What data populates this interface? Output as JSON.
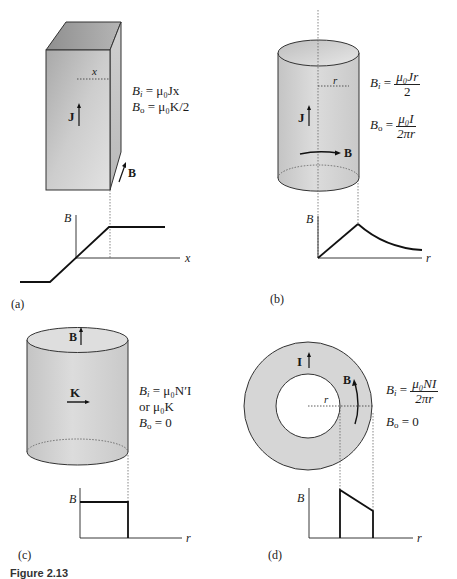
{
  "figure": {
    "caption_prefix": "Figure 2.13",
    "panels": [
      {
        "id": "a",
        "label": "(a)",
        "object": "thick slab",
        "labels": {
          "current_density": "J",
          "field": "B",
          "distance": "x"
        },
        "equations": {
          "inside_lhs": "B",
          "inside_sub": "i",
          "inside_rhs": "= μ₀Jx",
          "outside_lhs": "B",
          "outside_sub": "o",
          "outside_rhs": "= μ₀K/2"
        },
        "graph": {
          "ylabel": "B",
          "xlabel": "x"
        }
      },
      {
        "id": "b",
        "label": "(b)",
        "object": "solid cylinder",
        "labels": {
          "current_density": "J",
          "field": "B",
          "radius": "r"
        },
        "equations": {
          "inside_lhs": "B",
          "inside_sub": "i",
          "inside_num": "μ₀Jr",
          "inside_den": "2",
          "outside_lhs": "B",
          "outside_sub": "o",
          "outside_num": "μ₀I",
          "outside_den": "2πr"
        },
        "graph": {
          "ylabel": "B",
          "xlabel": "r"
        }
      },
      {
        "id": "c",
        "label": "(c)",
        "object": "solenoid",
        "labels": {
          "surface_current": "K",
          "field": "B"
        },
        "equations": {
          "inside_lhs": "B",
          "inside_sub": "i",
          "inside_rhs": "= μ₀N′I",
          "inside_alt": "or μ₀K",
          "outside_lhs": "B",
          "outside_sub": "o",
          "outside_rhs": "= 0"
        },
        "graph": {
          "ylabel": "B",
          "xlabel": "r"
        }
      },
      {
        "id": "d",
        "label": "(d)",
        "object": "toroid",
        "labels": {
          "current": "I",
          "field": "B",
          "radius": "r"
        },
        "equations": {
          "inside_lhs": "B",
          "inside_sub": "i",
          "inside_num": "μ₀NI",
          "inside_den": "2πr",
          "outside_lhs": "B",
          "outside_sub": "o",
          "outside_rhs": "= 0"
        },
        "graph": {
          "ylabel": "B",
          "xlabel": "r"
        }
      }
    ]
  }
}
